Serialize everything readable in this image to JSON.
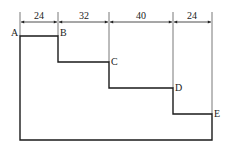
{
  "diagram": {
    "dimensions": [
      {
        "label": "24",
        "x1": 20,
        "x2": 58
      },
      {
        "label": "32",
        "x1": 58,
        "x2": 109
      },
      {
        "label": "40",
        "x1": 109,
        "x2": 173
      },
      {
        "label": "24",
        "x1": 173,
        "x2": 212
      }
    ],
    "points": [
      {
        "label": "A",
        "x": 20,
        "y": 36
      },
      {
        "label": "B",
        "x": 58,
        "y": 36
      },
      {
        "label": "C",
        "x": 109,
        "y": 62
      },
      {
        "label": "D",
        "x": 173,
        "y": 88
      },
      {
        "label": "E",
        "x": 212,
        "y": 114
      }
    ],
    "colors": {
      "line": "#1a1a1a",
      "guide": "#555555"
    }
  }
}
